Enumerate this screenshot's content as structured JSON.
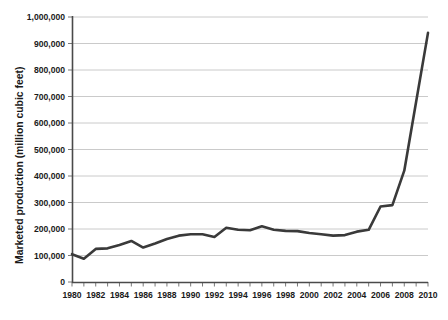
{
  "chart_data": {
    "type": "line",
    "title": "",
    "subtitle": "",
    "xlabel": "",
    "ylabel": "Marketed production (million cubic feet)",
    "xlim": [
      1980,
      2010
    ],
    "ylim": [
      0,
      1000000
    ],
    "grid": true,
    "legend": null,
    "legend_position": "none",
    "line_color": "#3a3a3a",
    "gridline_color": "#bdbdbd",
    "axis_color": "#4a4a4a",
    "y_ticks": [
      0,
      100000,
      200000,
      300000,
      400000,
      500000,
      600000,
      700000,
      800000,
      900000,
      1000000
    ],
    "y_tick_labels": [
      "0",
      "100,000",
      "200,000",
      "300,000",
      "400,000",
      "500,000",
      "600,000",
      "700,000",
      "800,000",
      "900,000",
      "1,000,000"
    ],
    "x_ticks": [
      1980,
      1982,
      1984,
      1986,
      1988,
      1990,
      1992,
      1994,
      1996,
      1998,
      2000,
      2002,
      2004,
      2006,
      2008,
      2010
    ],
    "x_tick_labels": [
      "1980",
      "1982",
      "1984",
      "1986",
      "1988",
      "1990",
      "1992",
      "1994",
      "1996",
      "1998",
      "2000",
      "2002",
      "2004",
      "2006",
      "2008",
      "2010"
    ],
    "x_minor_tick_interval": 1,
    "x": [
      1980,
      1981,
      1982,
      1983,
      1984,
      1985,
      1986,
      1987,
      1988,
      1989,
      1990,
      1991,
      1992,
      1993,
      1994,
      1995,
      1996,
      1997,
      1998,
      1999,
      2000,
      2001,
      2002,
      2003,
      2004,
      2005,
      2006,
      2007,
      2008,
      2009,
      2010
    ],
    "values": [
      105000,
      88000,
      125000,
      127000,
      140000,
      155000,
      130000,
      145000,
      162000,
      175000,
      180000,
      180000,
      170000,
      205000,
      197000,
      195000,
      210000,
      197000,
      193000,
      192000,
      185000,
      180000,
      175000,
      177000,
      190000,
      197000,
      285000,
      290000,
      420000,
      680000,
      940000
    ],
    "series": [
      {
        "name": "Marketed production",
        "values": [
          105000,
          88000,
          125000,
          127000,
          140000,
          155000,
          130000,
          145000,
          162000,
          175000,
          180000,
          180000,
          170000,
          205000,
          197000,
          195000,
          210000,
          197000,
          193000,
          192000,
          185000,
          180000,
          175000,
          177000,
          190000,
          197000,
          285000,
          290000,
          420000,
          680000,
          940000
        ]
      }
    ],
    "annotations": []
  },
  "figure": {
    "caption_partial": ""
  }
}
